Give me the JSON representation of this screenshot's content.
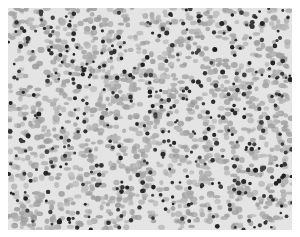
{
  "image": {
    "subject": "blood-smear-micrograph",
    "colors": {
      "background": "#ffffff",
      "field": "#e4e4e4",
      "rbc": "#a8a8a8",
      "nucleus": "#2e2e2e"
    },
    "counts": {
      "rbc": 1400,
      "nuclei": 420
    }
  }
}
